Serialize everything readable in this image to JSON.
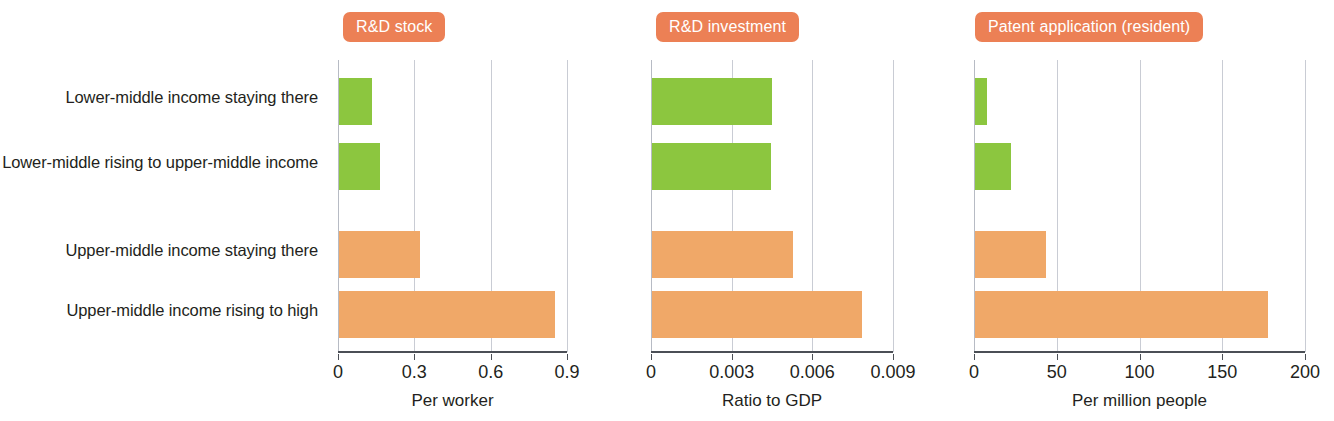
{
  "figure": {
    "row_labels": [
      "Lower-middle income staying there",
      "Lower-middle rising to upper-middle income",
      "Upper-middle income staying there",
      "Upper-middle income rising to high"
    ],
    "colors": {
      "green_bar": "#8cc63f",
      "orange_bar": "#f0a868",
      "badge": "#ec8055",
      "gridline": "#c9ccd4",
      "axis": "#4b4f56",
      "text": "#231f20"
    }
  },
  "chart_data": [
    {
      "type": "bar",
      "orientation": "horizontal",
      "title": "R&D stock",
      "xlabel": "Per worker",
      "ylabel": "",
      "categories": [
        "Lower-middle income staying there",
        "Lower-middle rising to upper-middle income",
        "Upper-middle income staying there",
        "Upper-middle income rising to high"
      ],
      "values": [
        0.13,
        0.16,
        0.32,
        0.85
      ],
      "bar_colors": [
        "#8cc63f",
        "#8cc63f",
        "#f0a868",
        "#f0a868"
      ],
      "xlim": [
        0,
        0.9
      ],
      "xticks": [
        0,
        0.3,
        0.6,
        0.9
      ],
      "xticklabels": [
        "0",
        "0.3",
        "0.6",
        "0.9"
      ],
      "grid": true,
      "legend": "none"
    },
    {
      "type": "bar",
      "orientation": "horizontal",
      "title": "R&D investment",
      "xlabel": "Ratio to GDP",
      "ylabel": "",
      "categories": [
        "Lower-middle income staying there",
        "Lower-middle rising to upper-middle income",
        "Upper-middle income staying there",
        "Upper-middle income rising to high"
      ],
      "values": [
        0.00445,
        0.00443,
        0.00525,
        0.0078
      ],
      "bar_colors": [
        "#8cc63f",
        "#8cc63f",
        "#f0a868",
        "#f0a868"
      ],
      "xlim": [
        0,
        0.009
      ],
      "xticks": [
        0,
        0.003,
        0.006,
        0.009
      ],
      "xticklabels": [
        "0",
        "0.003",
        "0.006",
        "0.009"
      ],
      "grid": true,
      "legend": "none"
    },
    {
      "type": "bar",
      "orientation": "horizontal",
      "title": "Patent application (resident)",
      "xlabel": "Per million people",
      "ylabel": "",
      "categories": [
        "Lower-middle income staying there",
        "Lower-middle rising to upper-middle income",
        "Upper-middle income staying there",
        "Upper-middle income rising to high"
      ],
      "values": [
        7.3,
        21.8,
        43.0,
        177.0
      ],
      "bar_colors": [
        "#8cc63f",
        "#8cc63f",
        "#f0a868",
        "#f0a868"
      ],
      "xlim": [
        0,
        200
      ],
      "xticks": [
        0,
        50,
        100,
        150,
        200
      ],
      "xticklabels": [
        "0",
        "50",
        "100",
        "150",
        "200"
      ],
      "grid": true,
      "legend": "none"
    }
  ]
}
